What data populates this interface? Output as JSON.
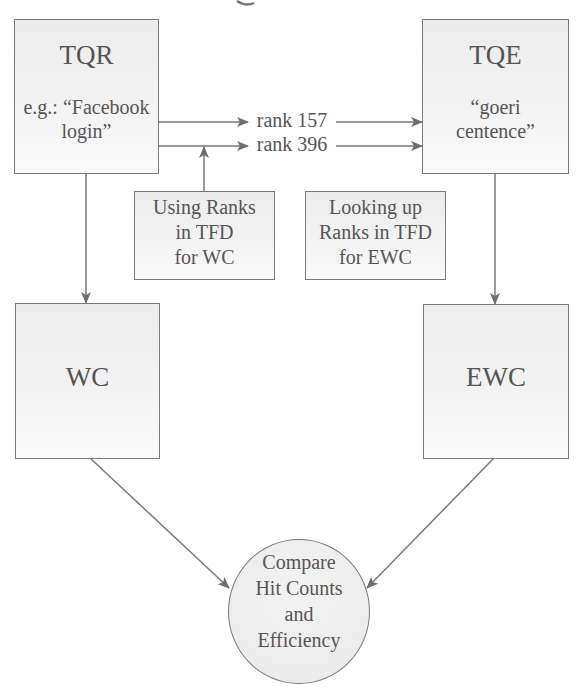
{
  "nodes": {
    "tqr": {
      "title": "TQR",
      "example_line1": "e.g.: “Facebook",
      "example_line2": "login”"
    },
    "tqe": {
      "title": "TQE",
      "example_line1": "“goeri",
      "example_line2": "centence”"
    },
    "using_ranks": {
      "line1": "Using Ranks",
      "line2": "in TFD",
      "line3": "for WC"
    },
    "looking_up": {
      "line1": "Looking up",
      "line2": "Ranks in TFD",
      "line3": "for EWC"
    },
    "wc": {
      "title": "WC"
    },
    "ewc": {
      "title": "EWC"
    },
    "compare": {
      "line1": "Compare",
      "line2": "Hit Counts",
      "line3": "and",
      "line4": "Efficiency"
    }
  },
  "edges": {
    "rank_top": "rank 157",
    "rank_bottom": "rank 396"
  },
  "colors": {
    "stroke": "#7a7a7a",
    "text": "#555555",
    "box_fill": "#ececec"
  }
}
